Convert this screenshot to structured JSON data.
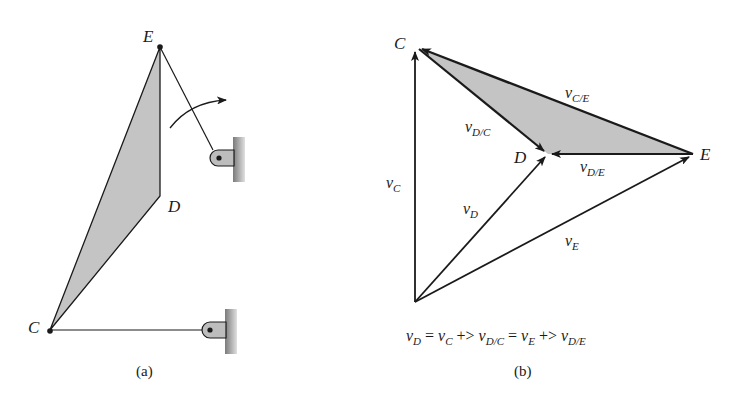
{
  "figure_a": {
    "caption": "(a)",
    "points": {
      "E": "E",
      "D": "D",
      "C": "C"
    }
  },
  "figure_b": {
    "caption": "(b)",
    "points": {
      "C": "C",
      "D": "D",
      "E": "E"
    },
    "vectors": {
      "v_C": {
        "main": "v",
        "sub": "C"
      },
      "v_D": {
        "main": "v",
        "sub": "D"
      },
      "v_E": {
        "main": "v",
        "sub": "E"
      },
      "v_DC": {
        "main": "v",
        "sub": "D/C"
      },
      "v_DE": {
        "main": "v",
        "sub": "D/E"
      },
      "v_CE": {
        "main": "v",
        "sub": "C/E"
      }
    },
    "equation": {
      "t1": "v",
      "s1": "D",
      "op1": " = ",
      "t2": "v",
      "s2": "C",
      "op2": " +> ",
      "t3": "v",
      "s3": "D/C",
      "op3": " = ",
      "t4": "v",
      "s4": "E",
      "op4": " +> ",
      "t5": "v",
      "s5": "D/E"
    }
  },
  "colors": {
    "ink": "#1a1a1a",
    "shade": "#c4c4c4",
    "wall": "#9a9a9a"
  }
}
